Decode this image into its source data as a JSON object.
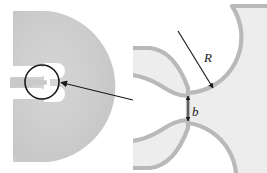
{
  "figure": {
    "background_color": "#ffffff",
    "panels": [
      {
        "id": "left-overview",
        "name": "overview-panel",
        "description": "D-shaped grey membrane with two white slots forming a narrow bridge",
        "shape": "half-disc",
        "fill_color": "#cfcfcf",
        "gradient_light": "#e2e2e2",
        "gradient_dark": "#bdbdbd",
        "slot_color": "#ffffff",
        "slot_count": 2
      },
      {
        "id": "right-detail",
        "name": "detail-panel",
        "description": "Magnified view of the constriction neck between two circular arcs",
        "fill_color": "#ededed",
        "edge_color": "#b9b9b9",
        "background_color": "#ffffff"
      }
    ],
    "callout": {
      "name": "magnifier-circle",
      "stroke_color": "#1a1a1a",
      "stroke_width": 1.6,
      "center_x": 42,
      "center_y": 82,
      "radius": 17
    },
    "connector_arrow": {
      "name": "callout-arrow",
      "from_x": 133,
      "from_y": 100,
      "to_x": 59,
      "to_y": 82,
      "color": "#1a1a1a"
    },
    "annotations": [
      {
        "id": "radius",
        "name": "radius-label",
        "symbol": "R",
        "meaning": "arc radius",
        "arrow": "single-headed",
        "tail_x": 178,
        "tail_y": 31,
        "head_x": 214,
        "head_y": 89,
        "label_x": 207,
        "label_y": 58
      },
      {
        "id": "gap",
        "name": "gap-label",
        "symbol": "b",
        "meaning": "neck width",
        "arrow": "double-headed",
        "top_x": 188,
        "top_y": 93,
        "bottom_x": 188,
        "bottom_y": 124,
        "label_x": 192,
        "label_y": 115
      }
    ],
    "colors": {
      "ink": "#1a1a1a",
      "membrane": "#cfcfcf",
      "detail_fill": "#ededed",
      "detail_edge": "#b9b9b9",
      "white": "#ffffff"
    }
  }
}
